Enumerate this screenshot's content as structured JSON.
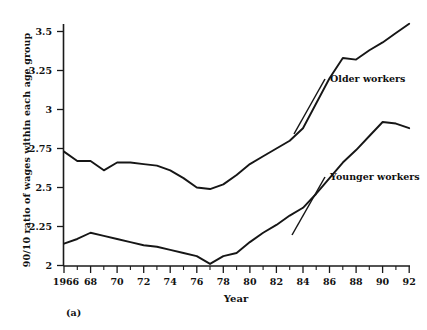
{
  "figure": {
    "panel_label": "(a)",
    "background_color": "#ffffff",
    "line_color": "#161616"
  },
  "chart_data": {
    "type": "line",
    "title": "",
    "xlabel": "Year",
    "ylabel": "90/10 ratio of wages within each age group",
    "xlim": [
      1966,
      1992
    ],
    "ylim": [
      2,
      3.5
    ],
    "grid": false,
    "legend_position": "inline-annotation",
    "x_tick_labels": [
      "1966",
      "68",
      "70",
      "72",
      "74",
      "76",
      "78",
      "80",
      "82",
      "84",
      "86",
      "88",
      "90",
      "92"
    ],
    "x_tick_values": [
      1966,
      1968,
      1970,
      1972,
      1974,
      1976,
      1978,
      1980,
      1982,
      1984,
      1986,
      1988,
      1990,
      1992
    ],
    "y_tick_labels": [
      "2",
      "2.25",
      "2.5",
      "2.75",
      "3",
      "3.25",
      "3.5"
    ],
    "y_tick_values": [
      2,
      2.25,
      2.5,
      2.75,
      3,
      3.25,
      3.5
    ],
    "x": [
      1966,
      1967,
      1968,
      1969,
      1970,
      1971,
      1972,
      1973,
      1974,
      1975,
      1976,
      1977,
      1978,
      1979,
      1980,
      1981,
      1982,
      1983,
      1984,
      1985,
      1986,
      1987,
      1988,
      1989,
      1990,
      1991,
      1992
    ],
    "series": [
      {
        "name": "Older workers",
        "label": "Older workers",
        "values": [
          2.73,
          2.67,
          2.67,
          2.61,
          2.66,
          2.66,
          2.65,
          2.64,
          2.61,
          2.56,
          2.5,
          2.49,
          2.52,
          2.58,
          2.65,
          2.7,
          2.75,
          2.8,
          2.88,
          3.04,
          3.2,
          3.33,
          3.32,
          3.38,
          3.43,
          3.49,
          3.55
        ]
      },
      {
        "name": "Younger workers",
        "label": "Younger workers",
        "values": [
          2.14,
          2.17,
          2.21,
          2.19,
          2.17,
          2.15,
          2.13,
          2.12,
          2.1,
          2.08,
          2.06,
          2.01,
          2.06,
          2.08,
          2.15,
          2.21,
          2.26,
          2.32,
          2.37,
          2.46,
          2.56,
          2.66,
          2.74,
          2.83,
          2.92,
          2.91,
          2.88
        ]
      }
    ],
    "annotations": [
      {
        "text": "Older workers",
        "attached_series": "Older workers"
      },
      {
        "text": "Younger workers",
        "attached_series": "Younger workers"
      }
    ]
  }
}
